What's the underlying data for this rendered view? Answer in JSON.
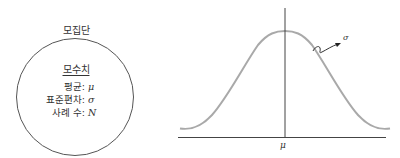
{
  "population": {
    "title": "모집단",
    "parameters_heading": "모수치",
    "rows": [
      {
        "label": "평균:",
        "symbol": "μ"
      },
      {
        "label": "표준편차:",
        "symbol": "σ"
      },
      {
        "label": "사례 수:",
        "symbol": "N"
      }
    ]
  },
  "distribution": {
    "type": "normal-curve",
    "center_label": "μ",
    "spread_label": "σ",
    "curve_color": "#a9a9a9",
    "axis_color": "#444444"
  }
}
